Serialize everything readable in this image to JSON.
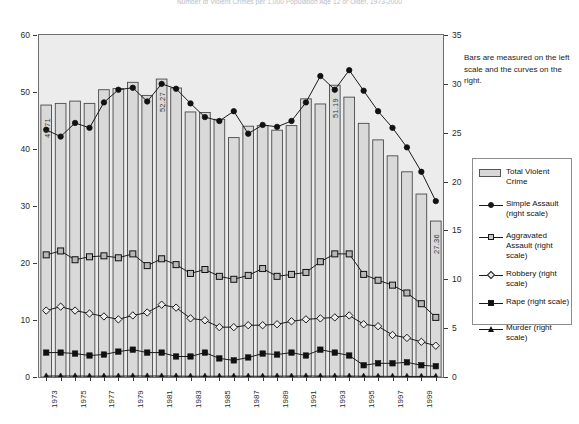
{
  "title": "Number of Violent Crimes per 1,000 Population Age 12 or Older, 1973-2000",
  "note": "Bars are measured on the left scale and the curves on the right.",
  "axes": {
    "left_ticks": [
      "0",
      "10",
      "20",
      "30",
      "40",
      "50",
      "60"
    ],
    "left_min": 0,
    "left_max": 60,
    "right_ticks": [
      "0",
      "5",
      "10",
      "15",
      "20",
      "25",
      "30",
      "35"
    ],
    "right_min": 0,
    "right_max": 35,
    "x_tick_labels": [
      "1973",
      "",
      "1975",
      "",
      "1977",
      "",
      "1979",
      "",
      "1981",
      "",
      "1983",
      "",
      "1985",
      "",
      "1987",
      "",
      "1989",
      "",
      "1991",
      "",
      "1993",
      "",
      "1995",
      "",
      "1997",
      "",
      "1999",
      ""
    ]
  },
  "legend": {
    "items": [
      {
        "label": "Total Violent Crime",
        "marker": "bar-swatch",
        "color": "#d8d8d8"
      },
      {
        "label": "Simple Assault (right scale)",
        "marker": "circle",
        "color": "#111111"
      },
      {
        "label": "Aggravated Assault (right scale)",
        "marker": "square-open",
        "color": "#111111"
      },
      {
        "label": "Robbery (right scale)",
        "marker": "diamond",
        "color": "#111111"
      },
      {
        "label": "Rape (right scale)",
        "marker": "square-solid",
        "color": "#111111"
      },
      {
        "label": "Murder (right scale)",
        "marker": "triangle",
        "color": "#111111"
      }
    ]
  },
  "chart_data": {
    "type": "bar",
    "title": "Number of Violent Crimes per 1,000 Population Age 12 or Older, 1973-2000",
    "xlabel": "",
    "ylabel": "Violent crimes per 1,000 (left: total; right: by type)",
    "ylim": [
      0,
      60
    ],
    "y2lim": [
      0,
      35
    ],
    "grid": false,
    "legend_position": "right",
    "categories": [
      "1973",
      "1974",
      "1975",
      "1976",
      "1977",
      "1978",
      "1979",
      "1980",
      "1981",
      "1982",
      "1983",
      "1984",
      "1985",
      "1986",
      "1987",
      "1988",
      "1989",
      "1990",
      "1991",
      "1992",
      "1993",
      "1994",
      "1995",
      "1996",
      "1997",
      "1998",
      "1999",
      "2000"
    ],
    "bar_series": {
      "name": "Total Violent Crime",
      "axis": "left",
      "values": [
        47.71,
        48.0,
        48.4,
        48.0,
        50.4,
        50.6,
        51.7,
        49.4,
        52.27,
        50.7,
        46.5,
        46.4,
        45.2,
        42.0,
        44.0,
        44.1,
        43.3,
        44.1,
        48.8,
        47.9,
        51.19,
        49.1,
        44.5,
        41.6,
        38.8,
        36.0,
        32.1,
        27.36
      ]
    },
    "bar_value_labels": [
      {
        "category": "1973",
        "value": 47.71,
        "text": "47.71"
      },
      {
        "category": "1981",
        "value": 52.27,
        "text": "52.27"
      },
      {
        "category": "1993",
        "value": 51.19,
        "text": "51.19"
      },
      {
        "category": "2000",
        "value": 27.36,
        "text": "27.36"
      }
    ],
    "series": [
      {
        "name": "Simple Assault (right scale)",
        "axis": "right",
        "marker": "circle",
        "values": [
          25.3,
          24.6,
          26.0,
          25.5,
          28.1,
          29.4,
          29.6,
          28.2,
          30.0,
          29.5,
          28.0,
          26.6,
          26.2,
          27.2,
          24.9,
          25.8,
          25.6,
          26.2,
          28.1,
          30.8,
          29.4,
          31.4,
          29.3,
          27.2,
          25.5,
          23.5,
          21.0,
          18.0
        ]
      },
      {
        "name": "Aggravated Assault (right scale)",
        "axis": "right",
        "marker": "square-open",
        "values": [
          12.5,
          12.9,
          12.0,
          12.3,
          12.4,
          12.2,
          12.6,
          11.4,
          12.1,
          11.5,
          10.6,
          11.0,
          10.3,
          10.0,
          10.4,
          11.1,
          10.3,
          10.5,
          10.7,
          11.8,
          12.6,
          12.6,
          10.5,
          9.9,
          9.4,
          8.6,
          7.5,
          6.1
        ]
      },
      {
        "name": "Robbery (right scale)",
        "axis": "right",
        "marker": "diamond",
        "values": [
          6.8,
          7.2,
          6.8,
          6.5,
          6.2,
          5.9,
          6.3,
          6.6,
          7.4,
          7.1,
          6.0,
          5.8,
          5.1,
          5.1,
          5.3,
          5.3,
          5.4,
          5.7,
          5.9,
          6.0,
          6.1,
          6.3,
          5.4,
          5.2,
          4.3,
          4.0,
          3.6,
          3.2
        ]
      },
      {
        "name": "Rape (right scale)",
        "axis": "right",
        "marker": "square-solid",
        "values": [
          2.5,
          2.5,
          2.4,
          2.2,
          2.3,
          2.6,
          2.8,
          2.5,
          2.5,
          2.1,
          2.1,
          2.5,
          1.9,
          1.7,
          2.0,
          2.4,
          2.3,
          2.5,
          2.2,
          2.8,
          2.5,
          2.2,
          1.2,
          1.4,
          1.4,
          1.5,
          1.2,
          1.1
        ]
      },
      {
        "name": "Murder (right scale)",
        "axis": "right",
        "marker": "triangle",
        "values": [
          0.1,
          0.1,
          0.1,
          0.09,
          0.09,
          0.09,
          0.1,
          0.1,
          0.1,
          0.09,
          0.08,
          0.08,
          0.08,
          0.09,
          0.08,
          0.08,
          0.09,
          0.09,
          0.1,
          0.09,
          0.09,
          0.09,
          0.08,
          0.07,
          0.07,
          0.06,
          0.06,
          0.06
        ]
      }
    ]
  }
}
